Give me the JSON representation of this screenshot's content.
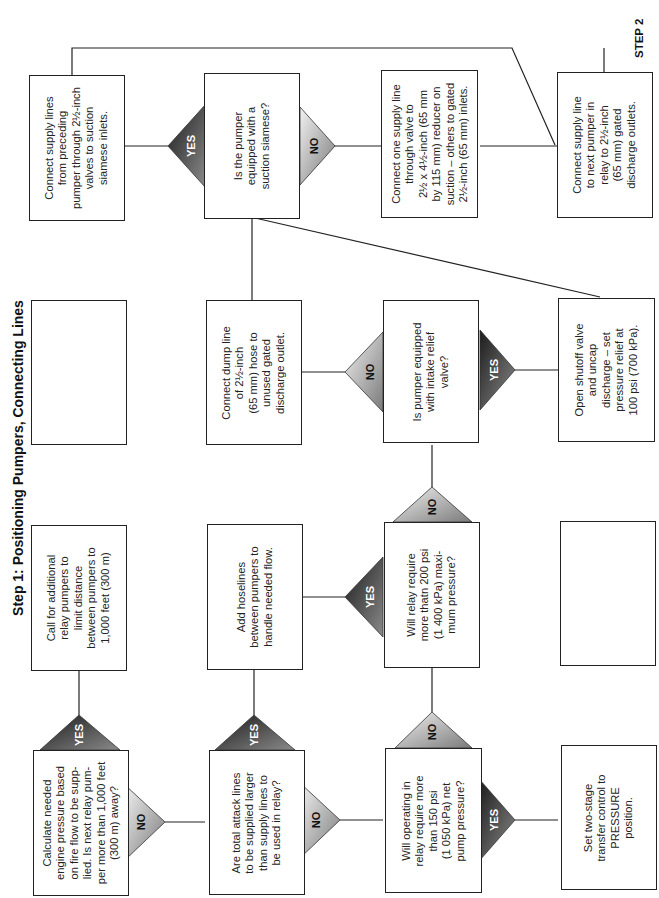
{
  "title": "Step 1: Positioning Pumpers, Connecting Lines",
  "step2_label": "STEP 2",
  "colors": {
    "yes_fill_dark": "#3a3a3a",
    "no_fill_light": "#d8d8d8",
    "line": "#222222",
    "box_border": "#222222"
  },
  "nodes": {
    "calc_pressure": "Calculate needed\nengine pressure based\non fire flow to be supp-\nlied. Is next relay pum-\nper more than 1,000 feet\n(300 m) away?",
    "call_additional": "Call for additional\nrelay pumpers to\nlimit distance\nbetween pumpers to\n1,000 feet (300 m)",
    "empty_box_1": "",
    "connect_supply_siamese": "Connect supply lines\nfrom preceding\npumper through 2½-inch\nvalves to suction\nsiamese inlets.",
    "attack_lines_larger": "Are total attack lines\nto be supplied larger\nthan supply lines to\nbe used in relay?",
    "add_hoselines": "Add hoselines\nbetween pumpers to\nhandle needed flow.",
    "connect_dump_line": "Connect dump line\nof 2½-inch\n(65 mm) hose to\nunused gated\ndischarge outlet.",
    "suction_siamese_q": "Is the pumper\nequipped with a\nsuction siamese?",
    "operating_150psi": "Will operating in\nrelay require more\nthan 150 psi\n(1 050 kPa) net\npump pressure?",
    "relay_200psi": "Will relay require\nmore thatn 200 psi\n(1 400 kPa) maxi-\nmum pressure?",
    "intake_relief_q": "Is pumper equipped\nwith intake relief\nvalve?",
    "connect_one_supply": "Connect one supply line\nthrough valve to\n2½ x 4½-inch (65 mm\nby 115 mm) reducer on\nsuction – others to gated\n2½-inch (65 mm) inlets.",
    "two_stage_transfer": "Set two-stage\ntransfer control to\nPRESSURE\nposition.",
    "empty_box_2": "",
    "open_shutoff": "Open shutoff valve\nand uncap\ndischarge – set\npressure relief at\n100 psi (700 kPa).",
    "connect_next_pumper": "Connect supply line\nto next pumper in\nrelay to 2½-inch\n(65 mm) gated\ndischarge outlets."
  },
  "decisions": {
    "yes": "YES",
    "no": "NO"
  }
}
